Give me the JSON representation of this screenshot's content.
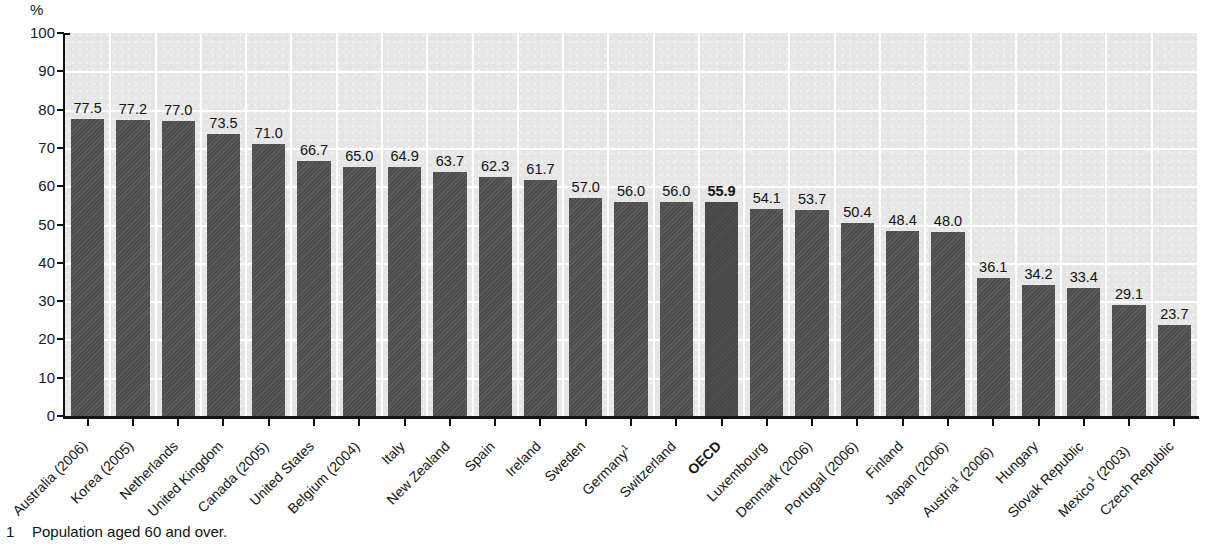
{
  "axis": {
    "unit_label": "%",
    "y_ticks": [
      "100",
      "90",
      "80",
      "70",
      "60",
      "50",
      "40",
      "30",
      "20",
      "10",
      "0"
    ]
  },
  "footnote": {
    "marker": "1",
    "text": "Population aged 60 and over."
  },
  "colors": {
    "bar": "#4d4d4d",
    "bar_highlight": "#474747",
    "plot_background": "#e6e6e6",
    "gridline": "#ffffff",
    "axis": "#111111",
    "text": "#1a1a1a"
  },
  "chart_data": {
    "type": "bar",
    "title": "",
    "xlabel": "",
    "ylabel": "%",
    "ylim": [
      0,
      100
    ],
    "ytick_step": 10,
    "grid": true,
    "legend": "none",
    "highlight_category": "OECD",
    "categories": [
      "Australia (2006)",
      "Korea  (2005)",
      "Netherlands",
      "United Kingdom",
      "Canada (2005)",
      "United States",
      "Belgium (2004)",
      "Italy",
      "New Zealand",
      "Spain",
      "Ireland",
      "Sweden",
      "Germany¹",
      "Switzerland",
      "OECD",
      "Luxembourg",
      "Denmark (2006)",
      "Portugal (2006)",
      "Finland",
      "Japan (2006)",
      "Austria¹ (2006)",
      "Hungary",
      "Slovak Republic",
      "Mexico¹ (2003)",
      "Czech Republic"
    ],
    "values": [
      77.5,
      77.2,
      77.0,
      73.5,
      71.0,
      66.7,
      65.0,
      64.9,
      63.7,
      62.3,
      61.7,
      57.0,
      56.0,
      56.0,
      55.9,
      54.1,
      53.7,
      50.4,
      48.4,
      48.0,
      36.1,
      34.2,
      33.4,
      29.1,
      23.7
    ],
    "value_labels": [
      "77.5",
      "77.2",
      "77.0",
      "73.5",
      "71.0",
      "66.7",
      "65.0",
      "64.9",
      "63.7",
      "62.3",
      "61.7",
      "57.0",
      "56.0",
      "56.0",
      "55.9",
      "54.1",
      "53.7",
      "50.4",
      "48.4",
      "48.0",
      "36.1",
      "34.2",
      "33.4",
      "29.1",
      "23.7"
    ],
    "category_labels_html": [
      "Australia (2006)",
      "Korea  (2005)",
      "Netherlands",
      "United Kingdom",
      "Canada (2005)",
      "United States",
      "Belgium (2004)",
      "Italy",
      "New Zealand",
      "Spain",
      "Ireland",
      "Sweden",
      "Germany<sup>1</sup>",
      "Switzerland",
      "OECD",
      "Luxembourg",
      "Denmark (2006)",
      "Portugal (2006)",
      "Finland",
      "Japan (2006)",
      "Austria<sup>1</sup> (2006)",
      "Hungary",
      "Slovak Republic",
      "Mexico<sup>1</sup> (2003)",
      "Czech Republic"
    ]
  }
}
